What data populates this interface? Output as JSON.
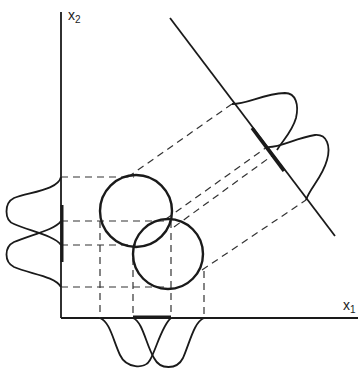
{
  "diagram": {
    "axes": {
      "x_label": "x",
      "x_sub": "1",
      "y_label": "x",
      "y_sub": "2"
    },
    "colors": {
      "stroke": "#1a1a1a",
      "dash": "#333333",
      "background": "#ffffff"
    },
    "classes": [
      {
        "name": "class-1",
        "center": [
          136,
          211
        ],
        "radius": 36
      },
      {
        "name": "class-2",
        "center": [
          168,
          254
        ],
        "radius": 35
      }
    ],
    "projections": [
      "x1-axis marginals",
      "x2-axis marginals",
      "oblique-line marginals"
    ]
  }
}
